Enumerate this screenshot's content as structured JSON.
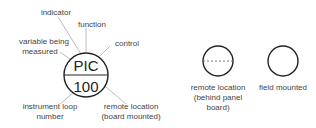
{
  "diagram": {
    "main_symbol": {
      "function_letters": "PIC",
      "loop_number": "100",
      "annotations": {
        "indicator": "indicator",
        "function": "function",
        "variable_line1": "variable being",
        "variable_line2": "measured",
        "control": "control",
        "loop_line1": "instrument loop",
        "loop_line2": "number",
        "remote_line1": "remote location",
        "remote_line2": "(board mounted)"
      }
    },
    "legend": {
      "behind_panel": {
        "line1": "remote location",
        "line2": "(behind panel",
        "line3": "board)"
      },
      "field_mounted": {
        "line1": "field mounted"
      }
    },
    "colors": {
      "stroke": "#222222",
      "leader": "#aaaaaa",
      "text": "#444444"
    }
  }
}
